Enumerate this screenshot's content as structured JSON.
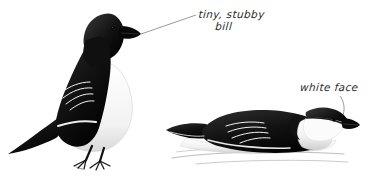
{
  "plate": {
    "width": 373,
    "height": 176,
    "background": "#ffffff",
    "subject": "Little Auk / Dovekie field-guide plate",
    "ink_color": "#1a1a1a",
    "text_color": "#2b2b2b",
    "leader_color": "#8a8a8a",
    "water_color": "#b8b8b8"
  },
  "annotations": {
    "bill": {
      "line1": "tiny, stubby",
      "line2": "bill"
    },
    "face": {
      "line1": "white face"
    }
  },
  "figures": {
    "standing": {
      "name": "standing bird",
      "pose": "perched, facing right"
    },
    "swimming": {
      "name": "swimming bird",
      "pose": "floating on water, facing right"
    }
  }
}
